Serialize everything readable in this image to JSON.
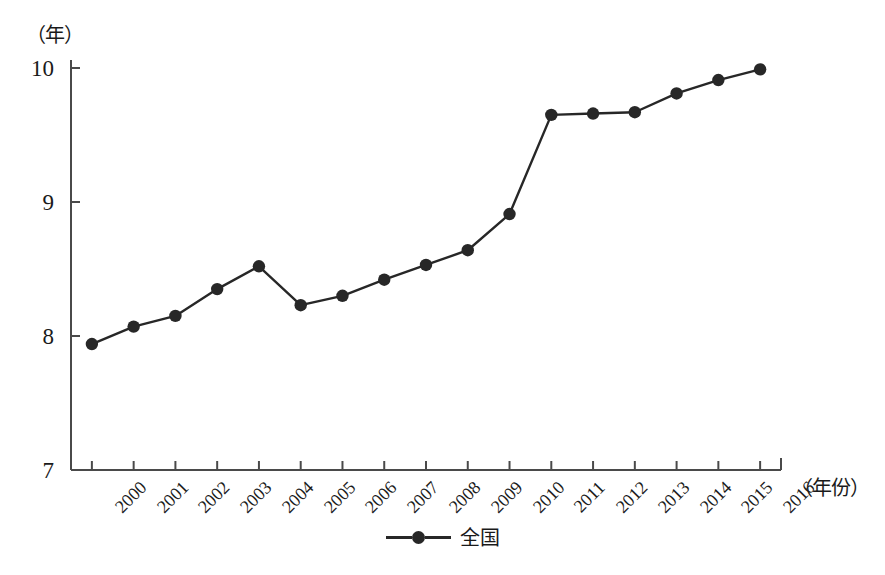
{
  "chart_data": {
    "type": "line",
    "title": "",
    "subtitle": "",
    "xlabel": "（年份）",
    "ylabel": "（年）",
    "ylim": [
      7,
      10
    ],
    "xlim": [
      2000,
      2016
    ],
    "yticks": [
      7,
      8,
      9,
      10
    ],
    "grid": false,
    "legend_position": "bottom-center",
    "categories": [
      "2000",
      "2001",
      "2002",
      "2003",
      "2004",
      "2005",
      "2006",
      "2007",
      "2008",
      "2009",
      "2010",
      "2011",
      "2012",
      "2013",
      "2014",
      "2015",
      "2016"
    ],
    "series": [
      {
        "name": "全国",
        "marker": "circle",
        "color": "#272727",
        "values": [
          7.94,
          8.07,
          8.15,
          8.35,
          8.52,
          8.23,
          8.3,
          8.42,
          8.53,
          8.64,
          8.91,
          9.65,
          9.66,
          9.67,
          9.81,
          9.91,
          9.99
        ]
      }
    ]
  },
  "axes": {
    "y_unit_label": "（年）",
    "x_unit_label": "（年份）",
    "ytick_labels": [
      "10",
      "9",
      "8",
      "7"
    ],
    "xtick_labels": [
      "2000",
      "2001",
      "2002",
      "2003",
      "2004",
      "2005",
      "2006",
      "2007",
      "2008",
      "2009",
      "2010",
      "2011",
      "2012",
      "2013",
      "2014",
      "2015",
      "2016"
    ]
  },
  "legend": {
    "items": [
      {
        "label": "全国",
        "color": "#272727"
      }
    ]
  },
  "caption": {
    "text": ""
  }
}
